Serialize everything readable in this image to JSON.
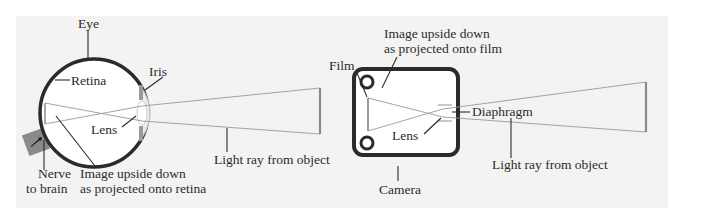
{
  "figure": {
    "background_color": "#f3f3f3",
    "line_color": "#2b2b2b",
    "eye": {
      "title": "Eye",
      "labels": {
        "retina": "Retina",
        "iris": "Iris",
        "lens": "Lens",
        "nerve_line1": "Nerve",
        "nerve_line2": "to brain",
        "image_line1": "Image upside down",
        "image_line2": "as projected onto retina",
        "light_ray": "Light ray from object"
      }
    },
    "camera": {
      "title": "Camera",
      "labels": {
        "film": "Film",
        "image_line1": "Image upside down",
        "image_line2": "as projected onto film",
        "diaphragm": "Diaphragm",
        "lens": "Lens",
        "light_ray": "Light ray from object"
      }
    }
  }
}
